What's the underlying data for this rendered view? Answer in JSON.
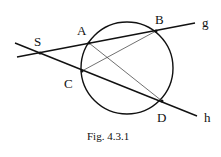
{
  "figure": {
    "caption": "Fig. 4.3.1",
    "points": {
      "S": {
        "label": "S",
        "x": 40,
        "y": 53
      },
      "A": {
        "label": "A",
        "x": 89,
        "y": 43
      },
      "B": {
        "label": "B",
        "x": 156,
        "y": 31
      },
      "C": {
        "label": "C",
        "x": 82,
        "y": 71
      },
      "D": {
        "label": "D",
        "x": 162,
        "y": 101
      }
    },
    "lines": {
      "g": {
        "label": "g"
      },
      "h": {
        "label": "h"
      }
    },
    "circle": {
      "cx": 127,
      "cy": 68,
      "r": 46
    }
  }
}
